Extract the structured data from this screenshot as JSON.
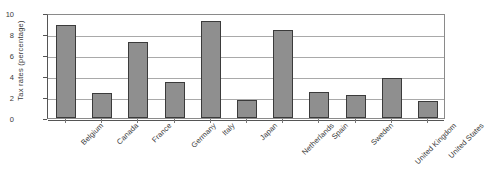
{
  "chart_data": {
    "type": "bar",
    "title": "",
    "xlabel": "",
    "ylabel": "Tax rates (percentage)",
    "ylim": [
      0,
      10
    ],
    "yticks": [
      0,
      2,
      4,
      6,
      8,
      10
    ],
    "grid": true,
    "legend": false,
    "legend_position": "none",
    "orientation": "vertical",
    "categories": [
      "Belgium",
      "Canada",
      "France",
      "Germany",
      "Italy",
      "Japan",
      "Netherlands",
      "Spain",
      "Sweden",
      "United Kingdom",
      "United States"
    ],
    "values": [
      8.85,
      2.35,
      7.25,
      3.45,
      9.2,
      1.7,
      8.4,
      2.5,
      2.2,
      3.85,
      1.65
    ],
    "series": [
      {
        "name": "Tax rates",
        "values": [
          8.85,
          2.35,
          7.25,
          3.45,
          9.2,
          1.7,
          8.4,
          2.5,
          2.2,
          3.85,
          1.65
        ]
      }
    ],
    "colors": {
      "bar_fill": "#8f8f8f",
      "bar_border": "#3b3b3b",
      "gridline": "#a9a9a9",
      "axis": "#555555",
      "frame": "#8a8a8a",
      "text": "#3a3a3a",
      "background": "#ffffff"
    },
    "label_rotation": -45
  }
}
